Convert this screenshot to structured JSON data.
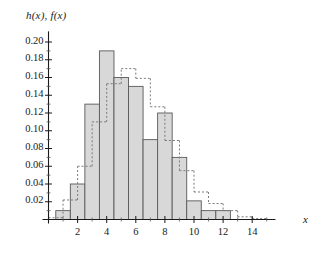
{
  "chart_data": {
    "type": "bar",
    "title": "",
    "subtitle": "",
    "ylabel": "h(x), f(x)",
    "xlabel": "x",
    "xlim": [
      0,
      15.6
    ],
    "ylim": [
      0,
      0.212
    ],
    "grid": false,
    "legend_position": "none",
    "annotations": [],
    "x_ticks_major": [
      2,
      4,
      6,
      8,
      10,
      12,
      14
    ],
    "x_ticks_minor": [
      1,
      3,
      5,
      7,
      9,
      11,
      13,
      15
    ],
    "x_tick_labels": [
      "2",
      "4",
      "6",
      "8",
      "10",
      "12",
      "14"
    ],
    "y_ticks": [
      0.02,
      0.04,
      0.06,
      0.08,
      0.1,
      0.12,
      0.14,
      0.16,
      0.18,
      0.2
    ],
    "y_tick_labels": [
      "0.02",
      "0.04",
      "0.06",
      "0.08",
      "0.10",
      "0.12",
      "0.14",
      "0.16",
      "0.18",
      "0.20"
    ],
    "series": [
      {
        "name": "h(x)",
        "style": "filled-histogram",
        "fill_color": "#d8d8d8",
        "edge_color": "#595959",
        "bin_width": 1,
        "bin_starts": [
          0.5,
          1.5,
          2.5,
          3.5,
          4.5,
          5.5,
          6.5,
          7.5,
          8.5,
          9.5,
          10.5,
          11.5,
          12.5
        ],
        "categories": [
          "0.5-1.5",
          "1.5-2.5",
          "2.5-3.5",
          "3.5-4.5",
          "4.5-5.5",
          "5.5-6.5",
          "6.5-7.5",
          "7.5-8.5",
          "8.5-9.5",
          "9.5-10.5",
          "10.5-11.5",
          "11.5-12.5",
          "12.5-13.5"
        ],
        "values": [
          0.01,
          0.04,
          0.13,
          0.19,
          0.16,
          0.15,
          0.09,
          0.12,
          0.07,
          0.021,
          0.01,
          0.01,
          0.0
        ]
      },
      {
        "name": "f(x)",
        "style": "dashed-step",
        "edge_color": "#7a7a7a",
        "dash": "2,2",
        "bin_width": 1,
        "bin_starts": [
          0.0,
          1.0,
          2.0,
          3.0,
          4.0,
          5.0,
          6.0,
          7.0,
          8.0,
          9.0,
          10.0,
          11.0,
          12.0,
          13.0,
          14.0
        ],
        "categories": [
          "0-1",
          "1-2",
          "2-3",
          "3-4",
          "4-5",
          "5-6",
          "6-7",
          "7-8",
          "8-9",
          "9-10",
          "10-11",
          "11-12",
          "12-13",
          "13-14",
          "14-15"
        ],
        "values": [
          0.002,
          0.022,
          0.06,
          0.11,
          0.153,
          0.17,
          0.159,
          0.127,
          0.089,
          0.055,
          0.031,
          0.018,
          0.01,
          0.003,
          0.001
        ]
      }
    ]
  }
}
